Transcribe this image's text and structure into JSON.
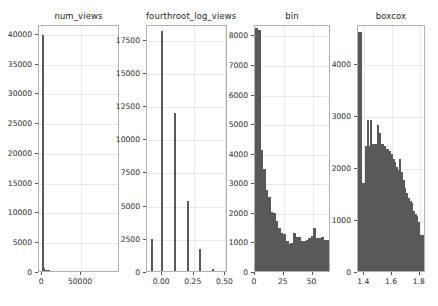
{
  "figure": {
    "width": 438,
    "height": 306,
    "background": "#ffffff",
    "bar_color": "#595959",
    "grid_color": "#e9e9e9",
    "frame_color": "#b0b0b0",
    "text_color": "#2b2b2b"
  },
  "chart_data": [
    {
      "type": "bar",
      "title": "num_views",
      "xlabel": "",
      "ylabel": "",
      "grid": true,
      "legend": "none",
      "xlim": [
        -4000,
        100000
      ],
      "ylim": [
        0,
        41500
      ],
      "xticks": [
        0,
        50000
      ],
      "xtick_labels": [
        "0",
        "50000"
      ],
      "yticks": [
        0,
        5000,
        10000,
        15000,
        20000,
        25000,
        30000,
        35000,
        40000
      ],
      "ytick_labels": [
        "0",
        "5000",
        "10000",
        "15000",
        "20000",
        "25000",
        "30000",
        "35000",
        "40000"
      ],
      "bin_edges": [
        0,
        2000,
        4000,
        6000,
        8000,
        10000
      ],
      "categories": [
        "0",
        "2000",
        "4000",
        "6000",
        "8000"
      ],
      "values": [
        39700,
        500,
        120,
        40,
        15
      ]
    },
    {
      "type": "bar",
      "title": "fourthroot_log_views",
      "xlabel": "",
      "ylabel": "",
      "grid": true,
      "legend": "none",
      "xlim": [
        -0.12,
        0.52
      ],
      "ylim": [
        0,
        18600
      ],
      "xticks": [
        0.0,
        0.25,
        0.5
      ],
      "xtick_labels": [
        "0.00",
        "0.25",
        "0.50"
      ],
      "yticks": [
        0,
        2500,
        5000,
        7500,
        10000,
        12500,
        15000,
        17500
      ],
      "ytick_labels": [
        "0",
        "2500",
        "5000",
        "7500",
        "10000",
        "12500",
        "15000",
        "17500"
      ],
      "categories": [
        "-0.08",
        "0.00",
        "0.10",
        "0.20",
        "0.30",
        "0.40"
      ],
      "x": [
        -0.08,
        0.0,
        0.1,
        0.205,
        0.3,
        0.4
      ],
      "values": [
        2400,
        18100,
        11900,
        5250,
        1650,
        180
      ]
    },
    {
      "type": "bar",
      "title": "bin",
      "xlabel": "",
      "ylabel": "",
      "grid": true,
      "legend": "none",
      "xlim": [
        0,
        66
      ],
      "ylim": [
        0,
        8350
      ],
      "xticks": [
        0,
        25,
        50
      ],
      "xtick_labels": [
        "0",
        "25",
        "50"
      ],
      "yticks": [
        0,
        1000,
        2000,
        3000,
        4000,
        5000,
        6000,
        7000,
        8000
      ],
      "ytick_labels": [
        "0",
        "1000",
        "2000",
        "3000",
        "4000",
        "5000",
        "6000",
        "7000",
        "8000"
      ],
      "bin_width": 2.2,
      "x": [
        1.1,
        3.3,
        5.5,
        7.7,
        9.9,
        12.1,
        14.3,
        16.5,
        18.7,
        20.9,
        23.1,
        25.3,
        27.5,
        29.7,
        31.9,
        34.1,
        36.3,
        38.5,
        40.7,
        42.9,
        45.1,
        47.3,
        49.5,
        51.7,
        53.9,
        56.1,
        58.3,
        60.5,
        62.7,
        64.9
      ],
      "values": [
        8200,
        8150,
        4100,
        3450,
        2750,
        2500,
        2000,
        1950,
        1700,
        1450,
        1300,
        1250,
        1000,
        900,
        950,
        1300,
        1150,
        1150,
        1000,
        1000,
        1050,
        1100,
        1200,
        1450,
        1100,
        1100,
        1150,
        1050,
        1050,
        1000
      ]
    },
    {
      "type": "bar",
      "title": "boxcox",
      "xlabel": "",
      "ylabel": "",
      "grid": true,
      "legend": "none",
      "xlim": [
        1.355,
        1.845
      ],
      "ylim": [
        0,
        4750
      ],
      "xticks": [
        1.4,
        1.6,
        1.8
      ],
      "xtick_labels": [
        "1.4",
        "1.6",
        "1.8"
      ],
      "yticks": [
        0,
        1000,
        2000,
        3000,
        4000
      ],
      "ytick_labels": [
        "0",
        "1000",
        "2000",
        "3000",
        "4000"
      ],
      "bin_width": 0.0123,
      "x": [
        1.362,
        1.374,
        1.387,
        1.399,
        1.411,
        1.424,
        1.436,
        1.448,
        1.46,
        1.473,
        1.485,
        1.497,
        1.51,
        1.522,
        1.534,
        1.546,
        1.559,
        1.571,
        1.583,
        1.596,
        1.608,
        1.62,
        1.632,
        1.645,
        1.657,
        1.669,
        1.682,
        1.694,
        1.706,
        1.718,
        1.731,
        1.743,
        1.755,
        1.768,
        1.78,
        1.792,
        1.805,
        1.817,
        1.829
      ],
      "values": [
        4600,
        4600,
        1700,
        1700,
        2400,
        2900,
        2400,
        2900,
        2450,
        2450,
        2450,
        2800,
        2650,
        2450,
        2450,
        2400,
        2350,
        2350,
        2300,
        2250,
        2150,
        2100,
        2000,
        1950,
        2150,
        1900,
        1750,
        1600,
        1500,
        1400,
        1350,
        1300,
        1150,
        1100,
        1050,
        950,
        700,
        700,
        250
      ]
    }
  ]
}
